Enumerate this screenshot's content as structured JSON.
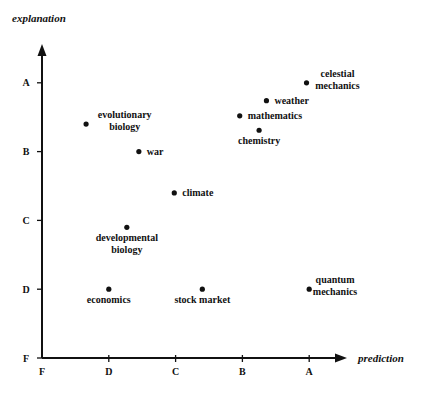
{
  "chart_data": {
    "type": "scatter",
    "title": "",
    "xlabel": "prediction",
    "ylabel": "explanation",
    "x_ticks": [
      "F",
      "D",
      "C",
      "B",
      "A"
    ],
    "y_ticks": [
      "F",
      "D",
      "C",
      "B",
      "A"
    ],
    "xlim": [
      0,
      4.5
    ],
    "ylim": [
      0,
      4.5
    ],
    "grade_scale": {
      "F": 0,
      "D": 1,
      "C": 2,
      "B": 3,
      "A": 4
    },
    "grid": false,
    "legend": "none",
    "points": [
      {
        "label": "evolutionary biology",
        "lines": [
          "evolutionary",
          "biology"
        ],
        "x": 0.66,
        "y": 3.4,
        "label_pos": "right-above"
      },
      {
        "label": "war",
        "lines": [
          "war"
        ],
        "x": 1.45,
        "y": 3.0,
        "label_pos": "right"
      },
      {
        "label": "climate",
        "lines": [
          "climate"
        ],
        "x": 1.98,
        "y": 2.4,
        "label_pos": "right"
      },
      {
        "label": "developmental biology",
        "lines": [
          "developmental",
          "biology"
        ],
        "x": 1.27,
        "y": 1.9,
        "label_pos": "below"
      },
      {
        "label": "economics",
        "lines": [
          "economics"
        ],
        "x": 1.0,
        "y": 1.0,
        "label_pos": "below"
      },
      {
        "label": "stock market",
        "lines": [
          "stock market"
        ],
        "x": 2.4,
        "y": 1.0,
        "label_pos": "below"
      },
      {
        "label": "quantum mechanics",
        "lines": [
          "quantum",
          "mechanics"
        ],
        "x": 4.0,
        "y": 1.0,
        "label_pos": "right-above"
      },
      {
        "label": "celestial mechanics",
        "lines": [
          "celestial",
          "mechanics"
        ],
        "x": 3.96,
        "y": 4.0,
        "label_pos": "right-above"
      },
      {
        "label": "weather",
        "lines": [
          "weather"
        ],
        "x": 3.36,
        "y": 3.74,
        "label_pos": "right"
      },
      {
        "label": "mathematics",
        "lines": [
          "mathematics"
        ],
        "x": 2.96,
        "y": 3.52,
        "label_pos": "right"
      },
      {
        "label": "chemistry",
        "lines": [
          "chemistry"
        ],
        "x": 3.25,
        "y": 3.31,
        "label_pos": "below"
      }
    ]
  }
}
